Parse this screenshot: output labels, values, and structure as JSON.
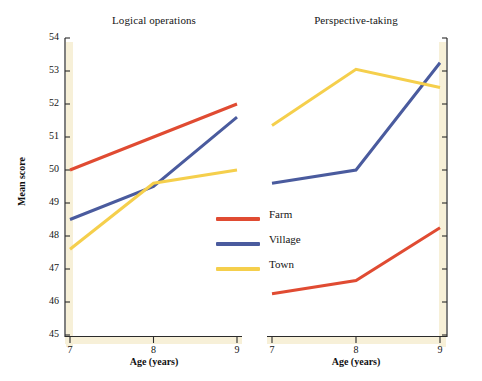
{
  "chart_data": {
    "type": "line",
    "title": "",
    "panels": [
      {
        "title": "Logical operations",
        "xlabel": "Age (years)",
        "ylabel": "Mean score",
        "x": [
          7,
          8,
          9
        ],
        "xticklabels": [
          "7",
          "8",
          "9"
        ],
        "ylim": [
          45,
          54
        ],
        "yticks": [
          45,
          46,
          47,
          48,
          49,
          50,
          51,
          52,
          53,
          54
        ],
        "yticklabels": [
          "45",
          "46",
          "47",
          "48",
          "49",
          "50",
          "51",
          "52",
          "53",
          "54"
        ],
        "axis_side": "left",
        "grid": false,
        "series": [
          {
            "name": "Farm",
            "values": [
              50.0,
              51.0,
              52.0
            ],
            "color": "#E04B32"
          },
          {
            "name": "Village",
            "values": [
              48.5,
              49.5,
              51.6
            ],
            "color": "#4A5B9E"
          },
          {
            "name": "Town",
            "values": [
              47.6,
              49.6,
              50.0
            ],
            "color": "#F5CF4C"
          }
        ]
      },
      {
        "title": "Perspective-taking",
        "xlabel": "Age (years)",
        "ylabel": "Mean score",
        "x": [
          7,
          8,
          9
        ],
        "xticklabels": [
          "7",
          "8",
          "9"
        ],
        "ylim": [
          45,
          54
        ],
        "yticks": [
          45,
          46,
          47,
          48,
          49,
          50,
          51,
          52,
          53,
          54
        ],
        "yticklabels": [
          "",
          "",
          "",
          "",
          "",
          "",
          "",
          "",
          "",
          ""
        ],
        "axis_side": "right",
        "grid": false,
        "series": [
          {
            "name": "Farm",
            "values": [
              46.25,
              46.65,
              48.25
            ],
            "color": "#E04B32"
          },
          {
            "name": "Village",
            "values": [
              49.6,
              50.0,
              53.25
            ],
            "color": "#4A5B9E"
          },
          {
            "name": "Town",
            "values": [
              51.35,
              53.05,
              52.5
            ],
            "color": "#F5CF4C"
          }
        ]
      }
    ],
    "legend": {
      "position": "center",
      "entries": [
        {
          "label": "Farm",
          "color": "#E04B32"
        },
        {
          "label": "Village",
          "color": "#4A5B9E"
        },
        {
          "label": "Town",
          "color": "#F5CF4C"
        }
      ]
    },
    "colors": {
      "farm": "#E04B32",
      "village": "#4A5B9E",
      "town": "#F5CF4C",
      "axis_line": "#2b2b2b",
      "axis_band": "#F7F0D8",
      "background": "#FFFFFF"
    }
  }
}
